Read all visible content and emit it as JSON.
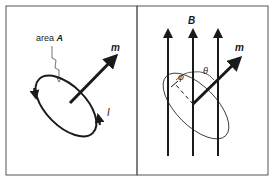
{
  "figure": {
    "left_panel": {
      "area_label_text": "area ",
      "area_label_symbol": "A",
      "moment_label": "m",
      "current_label": "I"
    },
    "right_panel": {
      "field_label": "B",
      "moment_label": "m",
      "angle_phi": "φ",
      "angle_theta": "θ"
    },
    "colors": {
      "ink": "#1a1a1a",
      "frame": "#555555",
      "background": "#ffffff"
    }
  }
}
